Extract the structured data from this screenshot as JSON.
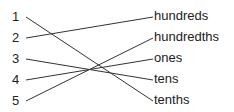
{
  "left_items": [
    {
      "label": "1",
      "y": 17
    },
    {
      "label": "2",
      "y": 38
    },
    {
      "label": "3",
      "y": 59
    },
    {
      "label": "4",
      "y": 80
    },
    {
      "label": "5",
      "y": 101
    }
  ],
  "right_items": [
    {
      "label": "hundreds",
      "y": 17
    },
    {
      "label": "hundredths",
      "y": 38
    },
    {
      "label": "ones",
      "y": 59
    },
    {
      "label": "tens",
      "y": 80
    },
    {
      "label": "tenths",
      "y": 101
    }
  ],
  "connections": [
    {
      "from": "1",
      "to": "tenths"
    },
    {
      "from": "2",
      "to": "hundreds"
    },
    {
      "from": "3",
      "to": "tens"
    },
    {
      "from": "4",
      "to": "ones"
    },
    {
      "from": "5",
      "to": "hundredths"
    }
  ],
  "line_color": "#333333"
}
